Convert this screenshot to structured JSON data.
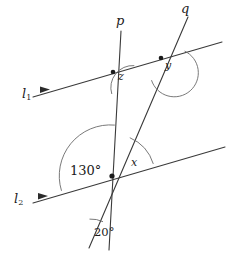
{
  "figure": {
    "width": 230,
    "height": 258,
    "background_color": "#ffffff",
    "stroke_color": "#3a3a3a",
    "text_color": "#1b1b1b"
  },
  "lines": {
    "l1": {
      "label": "l",
      "subscript": "1",
      "role": "parallel-line-upper",
      "start": [
        33,
        97
      ],
      "end": [
        222,
        42
      ],
      "direction_marker": "single-arrowhead"
    },
    "l2": {
      "label": "l",
      "subscript": "2",
      "role": "parallel-line-lower",
      "start": [
        33,
        203
      ],
      "end": [
        225,
        147
      ],
      "direction_marker": "single-arrowhead"
    },
    "p": {
      "label": "p",
      "role": "transversal-near-vertical",
      "start": [
        121,
        31
      ],
      "end": [
        109,
        250
      ]
    },
    "q": {
      "label": "q",
      "role": "transversal-slanted",
      "start": [
        188,
        17
      ],
      "end": [
        89,
        248
      ]
    }
  },
  "intersections": [
    {
      "name": "l1-p",
      "x": 113,
      "y": 72,
      "dot": true
    },
    {
      "name": "l1-q",
      "x": 161,
      "y": 58,
      "dot": true
    },
    {
      "name": "l2-p-q",
      "x": 112,
      "y": 176,
      "dot": true
    },
    {
      "name": "p-q-bottom",
      "x": 91,
      "y": 247,
      "dot": false
    }
  ],
  "angles": [
    {
      "id": "z",
      "label": "z",
      "kind": "variable",
      "at": "l1-p",
      "label_pos": [
        118,
        76
      ],
      "description": "angle between line p below intersection and line l1 to the right"
    },
    {
      "id": "y",
      "label": "y",
      "kind": "variable",
      "at": "l1-q",
      "label_pos": [
        165,
        65
      ],
      "description": "angle between line q below intersection and line l1 to the right"
    },
    {
      "id": "x",
      "label": "x",
      "kind": "variable",
      "at": "l2-p-q",
      "label_pos": [
        133,
        162
      ],
      "description": "angle between line q above intersection and line l2 to the right"
    },
    {
      "id": "angle-130",
      "label": "130°",
      "kind": "value",
      "at": "l2-p-q",
      "label_pos": [
        74,
        170
      ],
      "description": "angle between line l2 to the left and line p above intersection"
    },
    {
      "id": "angle-20",
      "label": "20°",
      "kind": "value",
      "at": "p-q-bottom",
      "label_pos": [
        96,
        233
      ],
      "description": "angle between line q and line p at their lower crossing"
    }
  ],
  "labels": {
    "p_pos": [
      116,
      15
    ],
    "q_pos": [
      181,
      2
    ],
    "l1_pos": [
      22,
      88
    ],
    "l2_pos": [
      14,
      193
    ]
  }
}
